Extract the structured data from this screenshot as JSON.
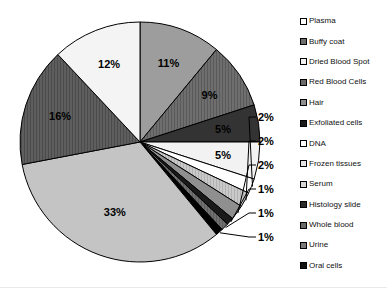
{
  "chart_data": {
    "type": "pie",
    "title": "",
    "subtitle": "",
    "xlabel": "",
    "ylabel": "",
    "grid": false,
    "legend_position": "right",
    "units": "percent",
    "start_angle_deg": 0,
    "direction": "clockwise",
    "categories": [
      "Plasma",
      "Buffy coat",
      "Dried Blood Spot",
      "Red Blood Cells",
      "Hair",
      "Exfoliated cells",
      "DNA",
      "Frozen tissues",
      "Serum",
      "Histology slide",
      "Whole blood",
      "Urine",
      "Oral cells"
    ],
    "values": [
      11,
      9,
      5,
      5,
      2,
      2,
      2,
      1,
      1,
      1,
      33,
      16,
      12
    ],
    "data_labels": [
      "11%",
      "9%",
      "5%",
      "5%",
      "2%",
      "2%",
      "2%",
      "1%",
      "1%",
      "1%",
      "33%",
      "16%",
      "12%"
    ],
    "slices": [
      {
        "label": "Plasma",
        "value": 11,
        "data_label": "11%",
        "fill": "#9d9d9d",
        "pattern": "solid",
        "label_placement": "inside",
        "label_color": "#000000"
      },
      {
        "label": "Buffy coat",
        "value": 9,
        "data_label": "9%",
        "fill": "#6e6e6e",
        "pattern": "vhatch",
        "label_placement": "inside",
        "label_color": "#000000"
      },
      {
        "label": "Dried Blood Spot",
        "value": 5,
        "data_label": "5%",
        "fill": "#333333",
        "pattern": "solid",
        "label_placement": "inside",
        "label_color": "#000000"
      },
      {
        "label": "Red Blood Cells",
        "value": 5,
        "data_label": "5%",
        "fill": "#f2f2f2",
        "pattern": "solid",
        "label_placement": "inside",
        "label_color": "#000000"
      },
      {
        "label": "Hair",
        "value": 2,
        "data_label": "2%",
        "fill": "#ffffff",
        "pattern": "solid",
        "label_placement": "outside",
        "label_color": "#000000"
      },
      {
        "label": "Exfoliated cells",
        "value": 2,
        "data_label": "2%",
        "fill": "#c9c9c9",
        "pattern": "vhatch",
        "label_placement": "outside",
        "label_color": "#000000"
      },
      {
        "label": "DNA",
        "value": 2,
        "data_label": "2%",
        "fill": "#8f8f8f",
        "pattern": "solid",
        "label_placement": "outside",
        "label_color": "#000000"
      },
      {
        "label": "Frozen tissues",
        "value": 1,
        "data_label": "1%",
        "fill": "#1a1a1a",
        "pattern": "solid",
        "label_placement": "outside",
        "label_color": "#000000"
      },
      {
        "label": "Serum",
        "value": 1,
        "data_label": "1%",
        "fill": "#707070",
        "pattern": "vhatch",
        "label_placement": "outside",
        "label_color": "#000000"
      },
      {
        "label": "Histology slide",
        "value": 1,
        "data_label": "1%",
        "fill": "#000000",
        "pattern": "solid",
        "label_placement": "outside",
        "label_color": "#000000"
      },
      {
        "label": "Whole blood",
        "value": 33,
        "data_label": "33%",
        "fill": "#c4c4c4",
        "pattern": "solid",
        "label_placement": "inside",
        "label_color": "#000000"
      },
      {
        "label": "Urine",
        "value": 16,
        "data_label": "16%",
        "fill": "#5e5e5e",
        "pattern": "vhatch",
        "label_placement": "inside",
        "label_color": "#000000"
      },
      {
        "label": "Oral cells",
        "value": 12,
        "data_label": "12%",
        "fill": "#f4f4f4",
        "pattern": "solid",
        "label_placement": "inside",
        "label_color": "#000000"
      }
    ],
    "legend": [
      {
        "label": "Plasma",
        "fill": "#ffffff"
      },
      {
        "label": "Buffy coat",
        "fill": "#6e6e6e"
      },
      {
        "label": "Dried Blood Spot",
        "fill": "#f2f2f2"
      },
      {
        "label": "Red Blood Cells",
        "fill": "#6a6a6a"
      },
      {
        "label": "Hair",
        "fill": "#8f8f8f"
      },
      {
        "label": "Exfoliated cells",
        "fill": "#1a1a1a"
      },
      {
        "label": "DNA",
        "fill": "#ffffff"
      },
      {
        "label": "Frozen tissues",
        "fill": "#e3e3e3"
      },
      {
        "label": "Serum",
        "fill": "#d4d4d4"
      },
      {
        "label": "Histology slide",
        "fill": "#2b2b2b"
      },
      {
        "label": "Whole blood",
        "fill": "#6a6a6a"
      },
      {
        "label": "Urine",
        "fill": "#7a7a7a"
      },
      {
        "label": "Oral cells",
        "fill": "#111111"
      }
    ]
  }
}
